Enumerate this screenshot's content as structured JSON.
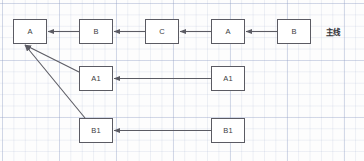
{
  "diagram": {
    "background": {
      "grid_color": "#96a5c8",
      "page_color": "#fdfdfd"
    },
    "style": {
      "node_border_color": "#5b5b63",
      "node_fill_color": "#ffffff",
      "edge_color": "#5b5b63",
      "text_color": "#3c3c42"
    },
    "side_label": "主线",
    "nodes": [
      {
        "id": "n-a-main",
        "label": "A",
        "x": 13,
        "y": 19,
        "w": 34,
        "h": 25
      },
      {
        "id": "n-b-main",
        "label": "B",
        "x": 79,
        "y": 19,
        "w": 34,
        "h": 25
      },
      {
        "id": "n-c-main",
        "label": "C",
        "x": 145,
        "y": 19,
        "w": 34,
        "h": 25
      },
      {
        "id": "n-a2-main",
        "label": "A",
        "x": 211,
        "y": 19,
        "w": 34,
        "h": 25
      },
      {
        "id": "n-b2-main",
        "label": "B",
        "x": 277,
        "y": 19,
        "w": 34,
        "h": 25
      },
      {
        "id": "n-a1-left",
        "label": "A1",
        "x": 79,
        "y": 66,
        "w": 34,
        "h": 25
      },
      {
        "id": "n-a1-right",
        "label": "A1",
        "x": 211,
        "y": 66,
        "w": 34,
        "h": 25
      },
      {
        "id": "n-b1-left",
        "label": "B1",
        "x": 79,
        "y": 118,
        "w": 34,
        "h": 25
      },
      {
        "id": "n-b1-right",
        "label": "B1",
        "x": 211,
        "y": 118,
        "w": 34,
        "h": 25
      }
    ],
    "edges": [
      {
        "id": "e-b-to-a",
        "from": "n-b-main",
        "to": "n-a-main",
        "x1": 79,
        "y1": 31.5,
        "x2": 48,
        "y2": 31.5
      },
      {
        "id": "e-c-to-b",
        "from": "n-c-main",
        "to": "n-b-main",
        "x1": 145,
        "y1": 31.5,
        "x2": 114,
        "y2": 31.5
      },
      {
        "id": "e-a2-to-c",
        "from": "n-a2-main",
        "to": "n-c-main",
        "x1": 211,
        "y1": 31.5,
        "x2": 180,
        "y2": 31.5
      },
      {
        "id": "e-b2-to-a2",
        "from": "n-b2-main",
        "to": "n-a2-main",
        "x1": 277,
        "y1": 31.5,
        "x2": 246,
        "y2": 31.5
      },
      {
        "id": "e-a1r-to-a1l",
        "from": "n-a1-right",
        "to": "n-a1-left",
        "x1": 211,
        "y1": 78.5,
        "x2": 114,
        "y2": 78.5
      },
      {
        "id": "e-b1r-to-b1l",
        "from": "n-b1-right",
        "to": "n-b1-left",
        "x1": 211,
        "y1": 130.5,
        "x2": 114,
        "y2": 130.5
      },
      {
        "id": "e-a1l-to-a",
        "from": "n-a1-left",
        "to": "n-a-main",
        "x1": 79,
        "y1": 72,
        "x2": 25,
        "y2": 45
      },
      {
        "id": "e-b1l-to-a",
        "from": "n-b1-left",
        "to": "n-a-main",
        "x1": 85,
        "y1": 118,
        "x2": 25,
        "y2": 45
      }
    ]
  }
}
